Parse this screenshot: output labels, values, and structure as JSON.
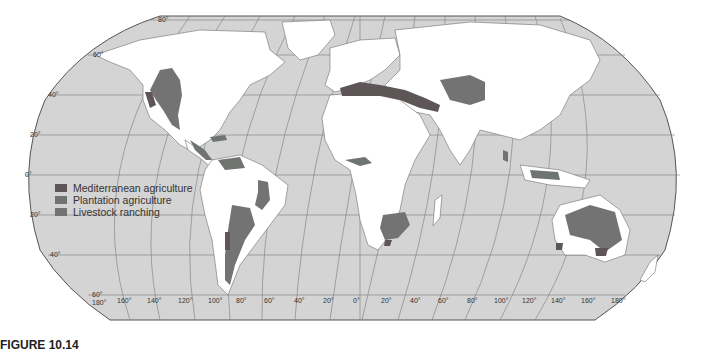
{
  "map": {
    "projection": "Robinson-like world map",
    "colors": {
      "ocean": "#d4d4d4",
      "land": "#ffffff",
      "border": "#6e6e6e",
      "graticule": "#7a7a7a",
      "outline": "#555555"
    },
    "latitude_labels_left": [
      "80°",
      "60°",
      "40°",
      "20°",
      "0°",
      "20°",
      "40°",
      "60°"
    ],
    "longitude_labels_bottom": [
      "180°",
      "160°",
      "140°",
      "120°",
      "100°",
      "80°",
      "60°",
      "40°",
      "20°",
      "0°",
      "20°",
      "40°",
      "60°",
      "80°",
      "100°",
      "120°",
      "140°",
      "160°",
      "180°"
    ],
    "regions": [
      {
        "name": "Western North America",
        "type": "Livestock ranching"
      },
      {
        "name": "California coast",
        "type": "Mediterranean agriculture"
      },
      {
        "name": "Central America / Caribbean",
        "type": "Plantation agriculture"
      },
      {
        "name": "Northern South America",
        "type": "Plantation agriculture"
      },
      {
        "name": "Eastern Brazil",
        "type": "Livestock ranching"
      },
      {
        "name": "Pampas & Patagonia",
        "type": "Livestock ranching"
      },
      {
        "name": "Central Chile",
        "type": "Mediterranean agriculture"
      },
      {
        "name": "Mediterranean Basin",
        "type": "Mediterranean agriculture"
      },
      {
        "name": "Central Asia",
        "type": "Livestock ranching"
      },
      {
        "name": "West Africa coast",
        "type": "Plantation agriculture"
      },
      {
        "name": "Southern Africa",
        "type": "Livestock ranching"
      },
      {
        "name": "South Africa Cape",
        "type": "Mediterranean agriculture"
      },
      {
        "name": "South & Southeast Asia",
        "type": "Plantation agriculture"
      },
      {
        "name": "Australia",
        "type": "Livestock ranching"
      },
      {
        "name": "Southwest & South Australia",
        "type": "Mediterranean agriculture"
      }
    ]
  },
  "legend": {
    "items": [
      {
        "label": "Mediterranean agriculture",
        "color": "#5e5556"
      },
      {
        "label": "Plantation agriculture",
        "color": "#6f7470"
      },
      {
        "label": "Livestock ranching",
        "color": "#737373"
      }
    ]
  },
  "caption": {
    "figure": "FIGURE 10.14",
    "text": ""
  }
}
